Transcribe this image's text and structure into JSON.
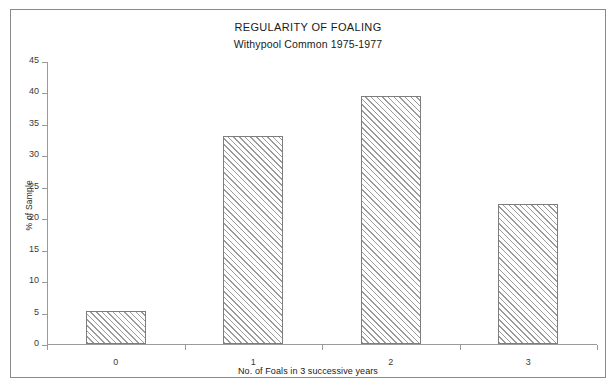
{
  "chart_data": {
    "type": "bar",
    "title": "REGULARITY OF FOALING",
    "subtitle": "Withypool Common 1975-1977",
    "xlabel": "No. of Foals in 3 successive years",
    "ylabel": "% of Sample",
    "categories": [
      "0",
      "1",
      "2",
      "3"
    ],
    "values": [
      5.2,
      33.0,
      39.5,
      22.3
    ],
    "ylim": [
      0,
      45
    ],
    "ytick_step": 5,
    "yticks": [
      "45",
      "40",
      "35",
      "30",
      "25",
      "20",
      "15",
      "10",
      "5",
      "0"
    ],
    "ytick_values": [
      45,
      40,
      35,
      30,
      25,
      20,
      15,
      10,
      5,
      0
    ],
    "grid": false,
    "legend": false,
    "series": [
      {
        "name": "% of Sample",
        "values": [
          5.2,
          33.0,
          39.5,
          22.3
        ]
      }
    ],
    "bar_fill": "diagonal-hatch",
    "bar_edge_color": "#7d7d7d",
    "hatch_color": "#9a9a9a",
    "axis_color": "#9a9a9a",
    "frame_color": "#8a8a8a",
    "background": "#ffffff"
  }
}
